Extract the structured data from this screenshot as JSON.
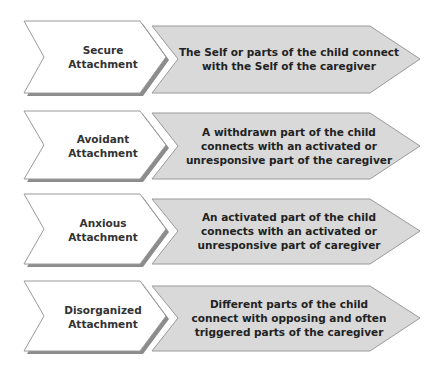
{
  "rows": [
    {
      "label": "Secure Attachment",
      "label_lines": [
        "Secure",
        "Attachment"
      ],
      "description": "The Self or parts of the child connect with the Self of the caregiver",
      "desc_lines": [
        "The Self or parts of the child connect",
        "with the Self of the caregiver"
      ]
    },
    {
      "label": "Avoidant Attachment",
      "label_lines": [
        "Avoidant",
        "Attachment"
      ],
      "description": "A withdrawn part of the child connects with an activated or unresponsive part of the caregiver",
      "desc_lines": [
        "A withdrawn part of the child",
        "connects with an activated or",
        "unresponsive part of the caregiver"
      ]
    },
    {
      "label": "Anxious Attachment",
      "label_lines": [
        "Anxious",
        "Attachment"
      ],
      "description": "An activated part of the child connects with an activated or unresponsive part of caregiver",
      "desc_lines": [
        "An activated part of the child",
        "connects with an activated or",
        "unresponsive part of caregiver"
      ]
    },
    {
      "label": "Disorganized Attachment",
      "label_lines": [
        "Disorganized",
        "Attachment"
      ],
      "description": "Different parts of the child connect with opposing and often triggered parts of the caregiver",
      "desc_lines": [
        "Different parts of the child",
        "connect with opposing and often",
        "triggered parts of the caregiver"
      ]
    }
  ],
  "colors": {
    "left_fill": "#ffffff",
    "right_fill": "#d9d9d9",
    "stroke": "#9a9a9a",
    "shadow": "#8c8c8c"
  }
}
